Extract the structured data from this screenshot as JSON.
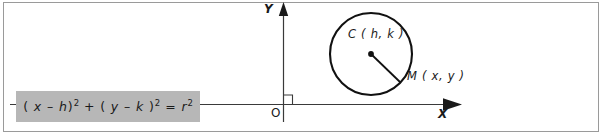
{
  "figure": {
    "type": "geometry-diagram",
    "background_color": "#ffffff",
    "border_color": "#9a9a9a",
    "ink_color": "#1a1a1a"
  },
  "formula": {
    "box_color": "#b7b7b7",
    "lead": "( ",
    "x": "x",
    "minus1": " – ",
    "h": "h",
    "close1": ")",
    "exp1": "2",
    "plus": " + ",
    "lead2": "( ",
    "y": "y",
    "minus2": " – ",
    "k": "k",
    "close2": " )",
    "exp2": "2",
    "equals": " = ",
    "r": "r",
    "exp3": "2",
    "plain": "( x – h)² + ( y – k )² = r²"
  },
  "axes": {
    "y_label": "Y",
    "x_label": "X",
    "origin_label": "O",
    "right_angle_marker": true,
    "x_axis_y": 104,
    "y_axis_x": 283
  },
  "circle": {
    "center_label": "C ( h, k )",
    "center_point_label": "C",
    "center_coords": "( h, k )",
    "point_label": "M ( x, y )",
    "point_name": "M",
    "point_coords": "( x, y )",
    "center_x": 371,
    "center_y": 54,
    "radius": 41,
    "radius_segment": "C to M"
  }
}
